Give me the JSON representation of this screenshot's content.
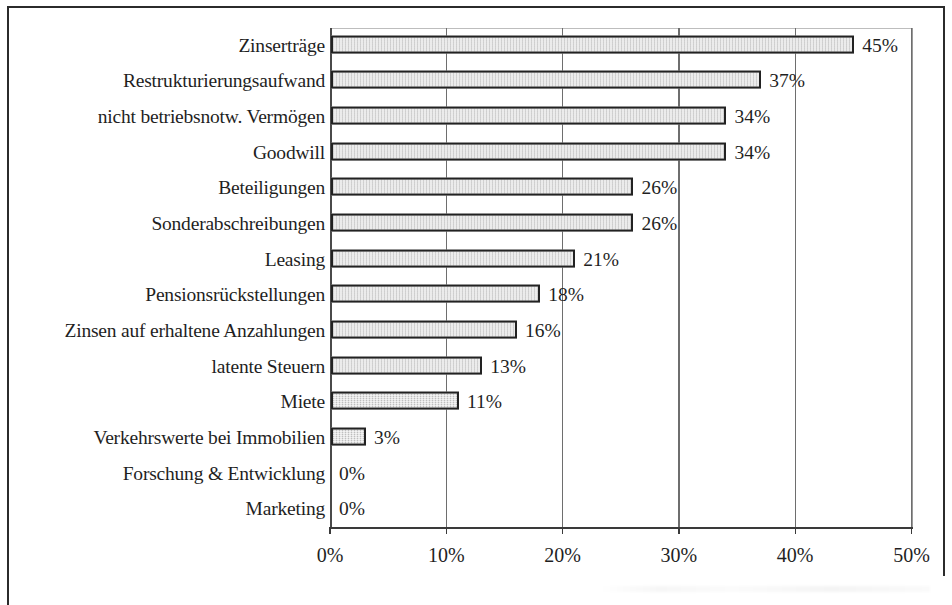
{
  "chart_data": {
    "type": "bar",
    "orientation": "horizontal",
    "title": "",
    "subtitle": "",
    "xlabel": "",
    "ylabel": "",
    "xlim": [
      0,
      50
    ],
    "xticks": [
      "0%",
      "10%",
      "20%",
      "30%",
      "40%",
      "50%"
    ],
    "xtick_values": [
      0,
      10,
      20,
      30,
      40,
      50
    ],
    "grid": "vertical",
    "legend": "none",
    "categories": [
      "Zinserträge",
      "Restrukturierungsaufwand",
      "nicht betriebsnotw. Vermögen",
      "Goodwill",
      "Beteiligungen",
      "Sonderabschreibungen",
      "Leasing",
      "Pensionsrückstellungen",
      "Zinsen auf erhaltene Anzahlungen",
      "latente Steuern",
      "Miete",
      "Verkehrswerte bei Immobilien",
      "Forschung & Entwicklung",
      "Marketing"
    ],
    "values": [
      45,
      37,
      34,
      34,
      26,
      26,
      21,
      18,
      16,
      13,
      11,
      3,
      0,
      0
    ],
    "data_labels": [
      "45%",
      "37%",
      "34%",
      "34%",
      "26%",
      "26%",
      "21%",
      "18%",
      "16%",
      "13%",
      "11%",
      "3%",
      "0%",
      "0%"
    ],
    "colors": {
      "bar_fill": "#d9d9d9",
      "bar_border": "#222222",
      "gridline": "#6e6e6e",
      "axis": "#3a3a3a",
      "text": "#1f1f1f",
      "frame": "#2b2b2b"
    }
  }
}
